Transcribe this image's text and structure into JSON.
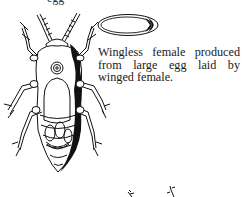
{
  "figure": {
    "top_fragment": "egg",
    "caption": "Wingless female produced from large egg laid by winged female.",
    "subjects": [
      {
        "name": "large-egg",
        "shape": "ellipse",
        "fill": "#ffffff",
        "shade": "#000000"
      },
      {
        "name": "wingless-female-insect",
        "style": "line-engraving"
      },
      {
        "name": "partial-insect-antennae",
        "position": "bottom-center"
      }
    ],
    "colors": {
      "ink": "#111111",
      "paper": "#ffffff"
    }
  }
}
